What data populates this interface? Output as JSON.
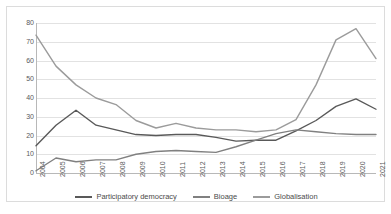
{
  "chart_data": {
    "type": "line",
    "title": "",
    "xlabel": "",
    "ylabel": "",
    "ylim": [
      0,
      80
    ],
    "ytick_step": 10,
    "yticks": [
      80,
      70,
      60,
      50,
      40,
      30,
      20,
      10,
      0
    ],
    "grid": true,
    "legend_position": "bottom",
    "categories": [
      "2004",
      "2005",
      "2006",
      "2007",
      "2008",
      "2009",
      "2010",
      "2011",
      "2012",
      "2013",
      "2014",
      "2015",
      "2016",
      "2017",
      "2018",
      "2019",
      "2020",
      "2021"
    ],
    "series": [
      {
        "name": "Participatory democracy",
        "color": "#595959",
        "values": [
          14.5,
          25.5,
          33.5,
          25.5,
          23,
          20.5,
          20,
          20.5,
          20.5,
          19,
          17,
          17.5,
          17.5,
          22.5,
          28,
          35.5,
          39.5,
          34
        ]
      },
      {
        "name": "Bioage",
        "color": "#808080",
        "values": [
          1.2,
          8,
          6,
          7,
          7,
          10,
          11.5,
          12,
          11.5,
          11,
          14,
          17.5,
          21,
          23,
          22,
          21,
          20.5,
          20.5
        ]
      },
      {
        "name": "Globalisation",
        "color": "#9b9b9b",
        "values": [
          73.5,
          57,
          47,
          40,
          36.5,
          28,
          24,
          26.5,
          24,
          23,
          23,
          22,
          23,
          28.5,
          47,
          71,
          77,
          61
        ]
      }
    ]
  },
  "legend": {
    "items": [
      {
        "label": "Participatory democracy",
        "color": "#595959"
      },
      {
        "label": "Bioage",
        "color": "#808080"
      },
      {
        "label": "Globalisation",
        "color": "#9b9b9b"
      }
    ]
  }
}
